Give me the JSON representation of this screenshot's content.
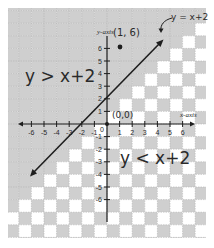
{
  "chart_data": {
    "type": "line",
    "title": "",
    "xlabel": "x-axis",
    "ylabel": "y-axis",
    "xlim": [
      -7,
      7
    ],
    "ylim": [
      -7,
      7
    ],
    "x_ticks": [
      -6,
      -5,
      -4,
      -3,
      -2,
      -1,
      0,
      1,
      2,
      3,
      4,
      5,
      6
    ],
    "y_ticks": [
      -6,
      -5,
      -4,
      -3,
      -2,
      -1,
      1,
      2,
      3,
      4,
      5,
      6
    ],
    "grid": true,
    "series": [
      {
        "name": "y = x+2",
        "equation": "y = x + 2",
        "x": [
          -6,
          4.5
        ],
        "y": [
          -4,
          6.5
        ],
        "style": "solid line with arrows at both ends"
      }
    ],
    "points": [
      {
        "label": "(1, 6)",
        "x": 1,
        "y": 6
      },
      {
        "label": "(0, 0)",
        "x": 0,
        "y": 0
      }
    ],
    "regions": [
      {
        "label": "y > x+2",
        "shading": "solid gray (above line)"
      },
      {
        "label": "y < x+2",
        "shading": "checkerboard (below line)"
      }
    ],
    "annotations": [
      "y = x+2",
      "(1, 6)",
      "(0, 0)",
      "y > x+2",
      "y < x+2",
      "x-axis",
      "y-axis"
    ]
  },
  "labels": {
    "line_label": "y = x+2",
    "point_label": "(1, 6)",
    "origin_label": "(0,0)",
    "above_region": "y > x+2",
    "below_region": "y < x+2",
    "x_axis_name": "x-axis",
    "y_axis_name": "y-axis",
    "zero": "0"
  },
  "colors": {
    "shade": "#cfcfcf",
    "white": "#ffffff",
    "grid_line": "#b4b4b4",
    "ink": "#1e1e1e"
  }
}
